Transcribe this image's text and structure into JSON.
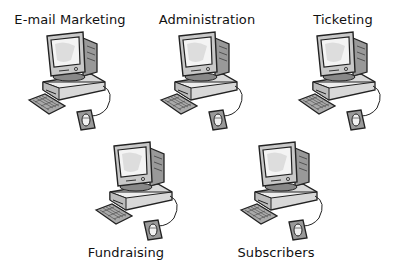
{
  "diagram": {
    "background": "#ffffff",
    "nodes": [
      {
        "id": "email",
        "label": "E-mail Marketing",
        "icon": "computer-icon",
        "label_position": "top",
        "label_x": 70,
        "label_y": 12,
        "icon_x": 25,
        "icon_y": 30
      },
      {
        "id": "admin",
        "label": "Administration",
        "icon": "computer-icon",
        "label_position": "top",
        "label_x": 207,
        "label_y": 12,
        "icon_x": 157,
        "icon_y": 30
      },
      {
        "id": "ticketing",
        "label": "Ticketing",
        "icon": "computer-icon",
        "label_position": "top",
        "label_x": 343,
        "label_y": 12,
        "icon_x": 295,
        "icon_y": 30
      },
      {
        "id": "fundraising",
        "label": "Fundraising",
        "icon": "computer-icon",
        "label_position": "bottom",
        "label_x": 126,
        "label_y": 245,
        "icon_x": 92,
        "icon_y": 140
      },
      {
        "id": "subscribers",
        "label": "Subscribers",
        "icon": "computer-icon",
        "label_position": "bottom",
        "label_x": 276,
        "label_y": 245,
        "icon_x": 237,
        "icon_y": 140
      }
    ]
  }
}
